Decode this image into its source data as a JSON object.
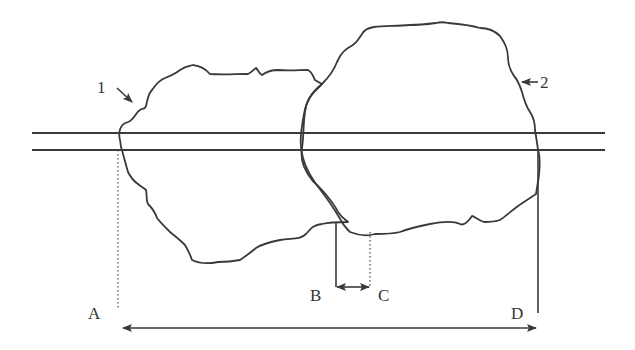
{
  "diagram": {
    "labels": {
      "particle1": "1",
      "particle2": "2",
      "a": "A",
      "b": "B",
      "c": "C",
      "d": "D"
    },
    "elements": {
      "particle1": "irregular outline, left (particle 1)",
      "particle2": "irregular outline, right (particle 2)",
      "horizontal_lines": 2,
      "measure_AD": "double-headed arrow from A to D",
      "measure_BC": "double-headed arrow from B to C"
    },
    "colors": {
      "stroke": "#3a3a3a",
      "background": "#ffffff",
      "text": "#333333"
    }
  }
}
